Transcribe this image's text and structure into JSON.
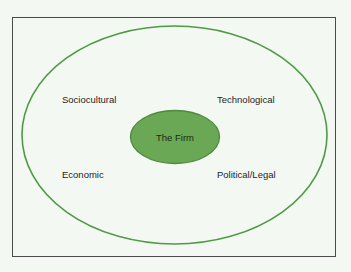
{
  "diagram": {
    "center": {
      "label": "The Firm",
      "fill": "#6aa856",
      "stroke": "#4d8a3e"
    },
    "outer_ring": {
      "stroke": "#4f9a45"
    },
    "factors": [
      {
        "label": "Sociocultural",
        "position": "top-left"
      },
      {
        "label": "Technological",
        "position": "top-right"
      },
      {
        "label": "Economic",
        "position": "bottom-left"
      },
      {
        "label": "Political/Legal",
        "position": "bottom-right"
      }
    ],
    "background": "#f4f8f2",
    "frame_color": "#4a4a4a"
  }
}
